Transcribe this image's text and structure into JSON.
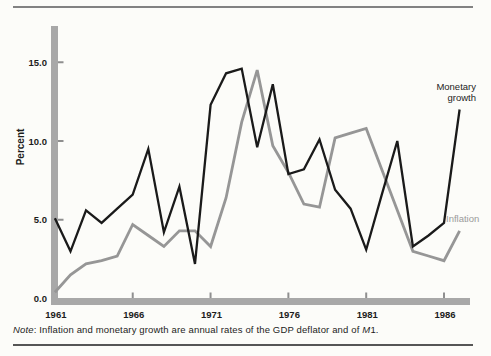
{
  "figure": {
    "note": {
      "parts": [
        {
          "text": "Note",
          "italic": true
        },
        {
          "text": ": Inflation and monetary growth are annual rates of the GDP deflator and of ",
          "italic": false
        },
        {
          "text": "M",
          "italic": true
        },
        {
          "text": "1.",
          "italic": false
        }
      ]
    }
  },
  "chart_data": {
    "type": "line",
    "title": "",
    "xlabel": "",
    "ylabel": "Percent",
    "grid": false,
    "legend": "inline-annotations",
    "xlim": [
      1961,
      1988
    ],
    "ylim": [
      0,
      17
    ],
    "axis_color": "#a8a8a8",
    "x": [
      1961,
      1962,
      1963,
      1964,
      1965,
      1966,
      1967,
      1968,
      1969,
      1970,
      1971,
      1972,
      1973,
      1974,
      1975,
      1976,
      1977,
      1978,
      1979,
      1980,
      1981,
      1982,
      1983,
      1984,
      1985,
      1986,
      1987
    ],
    "series": [
      {
        "name": "Monetary growth",
        "color": "#1a1a1a",
        "stroke_width": 2.3,
        "values": [
          5.1,
          3.0,
          5.6,
          4.8,
          5.7,
          6.6,
          9.5,
          4.2,
          7.1,
          2.2,
          12.3,
          14.3,
          14.6,
          9.6,
          13.6,
          7.9,
          8.2,
          10.1,
          6.9,
          5.7,
          3.1,
          6.6,
          10.0,
          3.3,
          4.0,
          4.8,
          12.0
        ]
      },
      {
        "name": "Inflation",
        "color": "#969696",
        "stroke_width": 2.8,
        "values": [
          0.4,
          1.5,
          2.2,
          2.4,
          2.7,
          4.7,
          4.0,
          3.3,
          4.3,
          4.3,
          3.3,
          6.4,
          11.2,
          14.5,
          9.7,
          8.0,
          6.0,
          5.8,
          10.2,
          10.5,
          10.8,
          8.2,
          5.6,
          3.0,
          2.7,
          2.4,
          4.3
        ]
      }
    ],
    "xticks": [
      {
        "value": 1961,
        "label": "1961"
      },
      {
        "value": 1966,
        "label": "1966"
      },
      {
        "value": 1971,
        "label": "1971"
      },
      {
        "value": 1976,
        "label": "1976"
      },
      {
        "value": 1981,
        "label": "1981"
      },
      {
        "value": 1986,
        "label": "1986"
      }
    ],
    "yticks": [
      {
        "value": 0,
        "label": "0.0"
      },
      {
        "value": 5,
        "label": "5.0"
      },
      {
        "value": 10,
        "label": "10.0"
      },
      {
        "value": 15,
        "label": "15.0"
      }
    ]
  }
}
